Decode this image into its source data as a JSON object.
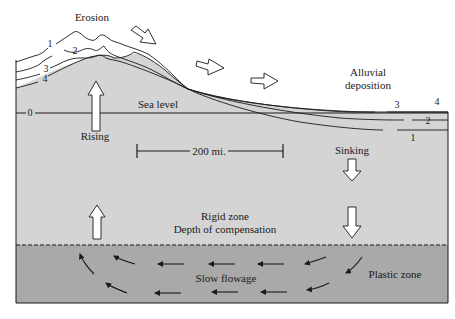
{
  "labels": {
    "erosion": "Erosion",
    "alluvial_line1": "Alluvial",
    "alluvial_line2": "deposition",
    "sea_level": "Sea level",
    "rising": "Rising",
    "sinking": "Sinking",
    "scale_bar": "200 mi.",
    "rigid_zone": "Rigid zone",
    "depth_of_compensation": "Depth of compensation",
    "slow_flowage": "Slow flowage",
    "plastic_zone": "Plastic zone"
  },
  "profile_numbers": {
    "left": [
      "1",
      "2",
      "3",
      "4"
    ],
    "sea_level": "0",
    "right": [
      "3",
      "4",
      "2",
      "1"
    ]
  },
  "colors": {
    "rigid_zone": "#d4d4d4",
    "plastic_zone": "#a9a9a9",
    "line": "#1a1a1a",
    "arrow_fill": "#ffffff"
  }
}
